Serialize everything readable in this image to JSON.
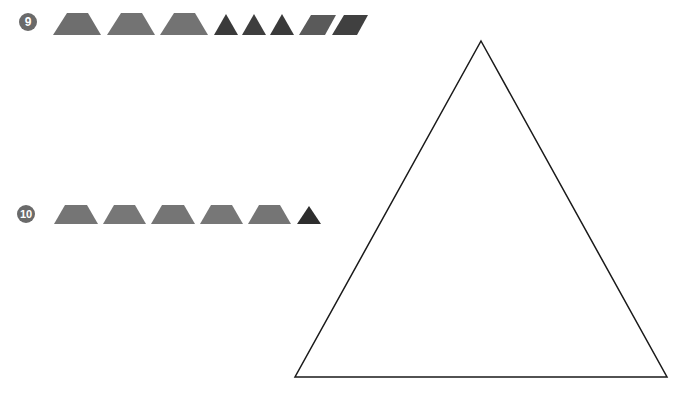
{
  "problems": [
    {
      "number": "9",
      "badge": {
        "cx": 28,
        "cy": 22,
        "r": 9
      },
      "pieces": [
        {
          "type": "trapezoid",
          "points": "53,35 67,13 88,13 101,35",
          "color": "#6e6e6e"
        },
        {
          "type": "trapezoid",
          "points": "107,35 121,13 142,13 155,35",
          "color": "#737373"
        },
        {
          "type": "trapezoid",
          "points": "160,35 174,13 195,13 208,35",
          "color": "#737373"
        },
        {
          "type": "triangle",
          "points": "214,35 226,14 238,35",
          "color": "#3a3a3a"
        },
        {
          "type": "triangle",
          "points": "242,35 254,14 266,35",
          "color": "#3e3e3e"
        },
        {
          "type": "triangle",
          "points": "270,35 282,14 294,35",
          "color": "#3a3a3a"
        },
        {
          "type": "parallelogram",
          "points": "299,35 311,15 336,15 325,35",
          "color": "#5a5a5a"
        },
        {
          "type": "parallelogram",
          "points": "332,35 344,15 368,15 357,35",
          "color": "#404040"
        }
      ]
    },
    {
      "number": "10",
      "badge": {
        "cx": 26,
        "cy": 214,
        "r": 9
      },
      "pieces": [
        {
          "type": "trapezoid",
          "points": "54,224 65,205 87,205 98,224",
          "color": "#757575"
        },
        {
          "type": "trapezoid",
          "points": "103,224 114,205 135,205 146,224",
          "color": "#777777"
        },
        {
          "type": "trapezoid",
          "points": "151,224 162,205 184,205 195,224",
          "color": "#757575"
        },
        {
          "type": "trapezoid",
          "points": "200,224 211,205 232,205 243,224",
          "color": "#777777"
        },
        {
          "type": "trapezoid",
          "points": "248,224 259,205 280,205 291,224",
          "color": "#757575"
        },
        {
          "type": "triangle",
          "points": "297,224 309,206 321,224",
          "color": "#2e2e2e"
        }
      ]
    }
  ],
  "outline_triangle": {
    "points": "481,41 667,377 295,377",
    "stroke": "#1a1a1a",
    "stroke_width": 1.5
  },
  "badge_color": "#6a6a6a"
}
